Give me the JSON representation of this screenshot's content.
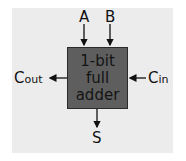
{
  "diagram": {
    "title": "1-bit full adder",
    "box": {
      "lines": [
        "1-bit",
        "full",
        "adder"
      ],
      "fill": "#5e5e5e",
      "border": "#2a2a2a"
    },
    "background": "#ececec",
    "inputs": [
      {
        "id": "A",
        "label": "A",
        "side": "top"
      },
      {
        "id": "B",
        "label": "B",
        "side": "top"
      },
      {
        "id": "Cin",
        "label_main": "C",
        "label_sub": "in",
        "side": "right"
      }
    ],
    "outputs": [
      {
        "id": "Cout",
        "label_main": "C",
        "label_sub": "out",
        "side": "left"
      },
      {
        "id": "S",
        "label": "S",
        "side": "bottom"
      }
    ]
  }
}
